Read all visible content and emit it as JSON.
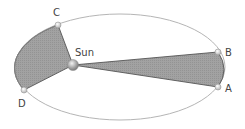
{
  "diagram": {
    "labels": {
      "sun": "Sun",
      "a": "A",
      "b": "B",
      "c": "C",
      "d": "D"
    },
    "colors": {
      "orbit": "#b0b0b0",
      "sector_fill": "#9a9a9a",
      "sector_edge": "#555555",
      "point": "#d8d8d8",
      "sun": "#aaaaaa"
    }
  }
}
